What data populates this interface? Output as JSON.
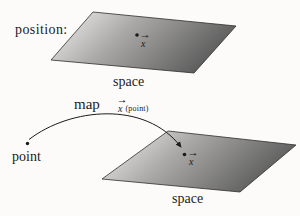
{
  "labels": {
    "position": "position:",
    "space_top": "space",
    "map": "map",
    "point": "point",
    "space_bottom": "space"
  },
  "math": {
    "x_symbol": "x",
    "vector_arrow": "→",
    "map_value_arg": "(point)"
  },
  "colors": {
    "background": "#fcfbf9",
    "plane_light": "#f6f5f3",
    "plane_mid": "#aaa9a7",
    "plane_dark": "#5e5e5e",
    "plane_outline": "#2f2d2b",
    "ink": "#1c1b19"
  }
}
